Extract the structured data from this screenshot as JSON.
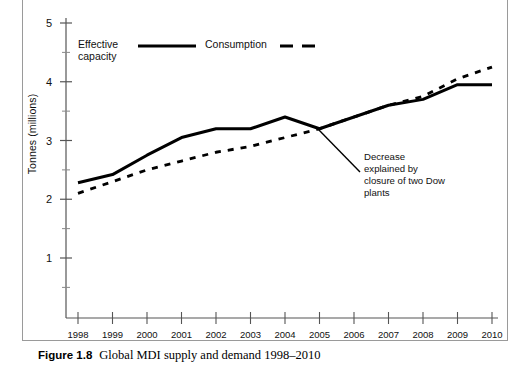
{
  "figure": {
    "caption_label": "Figure 1.8",
    "caption_text": "Global MDI supply and demand 1998–2010"
  },
  "chart_data": {
    "type": "line",
    "title": "",
    "xlabel": "",
    "ylabel": "Tonnes (millions)",
    "x": [
      1998,
      1999,
      2000,
      2001,
      2002,
      2003,
      2004,
      2005,
      2006,
      2007,
      2008,
      2009,
      2010
    ],
    "categories": [
      "1998",
      "1999",
      "2000",
      "2001",
      "2002",
      "2003",
      "2004",
      "2005",
      "2006",
      "2007",
      "2008",
      "2009",
      "2010"
    ],
    "series": [
      {
        "name": "Effective capacity",
        "style": "solid",
        "color": "#000000",
        "values": [
          2.28,
          2.42,
          2.75,
          3.05,
          3.2,
          3.2,
          3.4,
          3.2,
          3.4,
          3.6,
          3.7,
          3.95,
          3.95
        ]
      },
      {
        "name": "Consumption",
        "style": "dashed",
        "color": "#000000",
        "values": [
          2.1,
          2.3,
          2.5,
          2.65,
          2.8,
          2.9,
          3.05,
          3.2,
          3.4,
          3.6,
          3.75,
          4.05,
          4.25
        ]
      }
    ],
    "ylim": [
      0,
      5
    ],
    "xlim": [
      1998,
      2010
    ],
    "yticks": [
      1,
      2,
      3,
      4,
      5
    ],
    "yticks_minor": [
      0.5,
      1.5,
      2.5,
      3.5,
      4.5
    ],
    "ytick_labels": [
      "1",
      "2",
      "3",
      "4",
      "5"
    ],
    "grid": false,
    "legend_position": "top-left-inside",
    "annotations": [
      {
        "name": "decrease-annotation",
        "text_lines": [
          "Decrease",
          "explained by",
          "closure of two Dow",
          "plants"
        ],
        "points_to_x": 2005,
        "points_to_y": 3.2
      }
    ]
  },
  "legend": {
    "items": [
      {
        "label_line1": "Effective",
        "label_line2": "capacity",
        "style": "solid"
      },
      {
        "label_line1": "Consumption",
        "label_line2": "",
        "style": "dashed"
      }
    ]
  }
}
